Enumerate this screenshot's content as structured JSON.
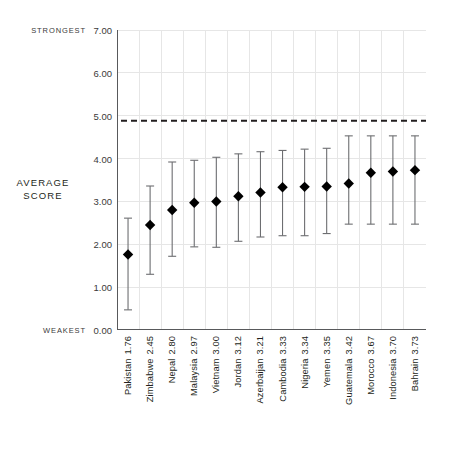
{
  "annotations": {
    "strongest": "STRONGEST",
    "weakest": "WEAKEST",
    "average_score": "AVERAGE\nSCORE",
    "average_score_line1": "AVERAGE",
    "average_score_line2": "SCORE"
  },
  "chart_data": {
    "type": "scatter",
    "title": "",
    "subtitle": "",
    "xlabel": "",
    "ylabel": "AVERAGE SCORE",
    "ylim": [
      0.0,
      7.0
    ],
    "ytick_labels": [
      "7.00",
      "6.00",
      "5.00",
      "4.00",
      "3.00",
      "2.00",
      "1.00",
      "0.00"
    ],
    "ytick_values": [
      7.0,
      6.0,
      5.0,
      4.0,
      3.0,
      2.0,
      1.0,
      0.0
    ],
    "grid": true,
    "grid_axis": "both",
    "legend": "none",
    "marker": "diamond",
    "marker_color": "#000000",
    "errorbar_color": "#6d6e71",
    "gridline_color": "#e6e6e6",
    "axis_color": "#58595b",
    "reference_line": {
      "value": 4.88,
      "style": "dashed",
      "color": "#231f20",
      "label": ""
    },
    "axis_endpoints": {
      "top_label": "STRONGEST",
      "bottom_label": "WEAKEST"
    },
    "categories": [
      "Pakistan",
      "Zimbabwe",
      "Nepal",
      "Malaysia",
      "Vietnam",
      "Jordan",
      "Azerbaijan",
      "Cambodia",
      "Nigeria",
      "Yemen",
      "Guatemala",
      "Morocco",
      "Indonesia",
      "Bahrain"
    ],
    "values": [
      1.76,
      2.45,
      2.8,
      2.97,
      3.0,
      3.12,
      3.21,
      3.33,
      3.34,
      3.35,
      3.42,
      3.67,
      3.7,
      3.73
    ],
    "value_labels": [
      "1.76",
      "2.45",
      "2.80",
      "2.97",
      "3.00",
      "3.12",
      "3.21",
      "3.33",
      "3.34",
      "3.35",
      "3.42",
      "3.67",
      "3.70",
      "3.73"
    ],
    "error_low": [
      0.47,
      1.3,
      1.72,
      1.94,
      1.93,
      2.07,
      2.17,
      2.2,
      2.2,
      2.25,
      2.47,
      2.47,
      2.47,
      2.47
    ],
    "error_high": [
      2.61,
      3.36,
      3.92,
      3.96,
      4.03,
      4.11,
      4.16,
      4.19,
      4.22,
      4.24,
      4.53,
      4.53,
      4.53,
      4.53
    ],
    "points": [
      {
        "category": "Pakistan",
        "value": 1.76,
        "low": 0.47,
        "high": 2.61,
        "label": "Pakistan 1.76"
      },
      {
        "category": "Zimbabwe",
        "value": 2.45,
        "low": 1.3,
        "high": 3.36,
        "label": "Zimbabwe 2.45"
      },
      {
        "category": "Nepal",
        "value": 2.8,
        "low": 1.72,
        "high": 3.92,
        "label": "Nepal 2.80"
      },
      {
        "category": "Malaysia",
        "value": 2.97,
        "low": 1.94,
        "high": 3.96,
        "label": "Malaysia 2.97"
      },
      {
        "category": "Vietnam",
        "value": 3.0,
        "low": 1.93,
        "high": 4.03,
        "label": "Vietnam 3.00"
      },
      {
        "category": "Jordan",
        "value": 3.12,
        "low": 2.07,
        "high": 4.11,
        "label": "Jordan 3.12"
      },
      {
        "category": "Azerbaijan",
        "value": 3.21,
        "low": 2.17,
        "high": 4.16,
        "label": "Azerbaijan 3.21"
      },
      {
        "category": "Cambodia",
        "value": 3.33,
        "low": 2.2,
        "high": 4.19,
        "label": "Cambodia 3.33"
      },
      {
        "category": "Nigeria",
        "value": 3.34,
        "low": 2.2,
        "high": 4.22,
        "label": "Nigeria 3.34"
      },
      {
        "category": "Yemen",
        "value": 3.35,
        "low": 2.25,
        "high": 4.24,
        "label": "Yemen 3.35"
      },
      {
        "category": "Guatemala",
        "value": 3.42,
        "low": 2.47,
        "high": 4.53,
        "label": "Guatemala 3.42"
      },
      {
        "category": "Morocco",
        "value": 3.67,
        "low": 2.47,
        "high": 4.53,
        "label": "Morocco 3.67"
      },
      {
        "category": "Indonesia",
        "value": 3.7,
        "low": 2.47,
        "high": 4.53,
        "label": "Indonesia 3.70"
      },
      {
        "category": "Bahrain",
        "value": 3.73,
        "low": 2.47,
        "high": 4.53,
        "label": "Bahrain 3.73"
      }
    ]
  }
}
